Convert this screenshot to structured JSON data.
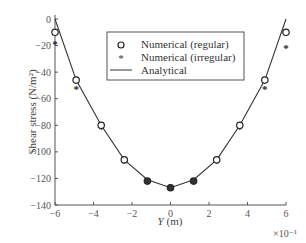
{
  "chart_data": {
    "type": "scatter",
    "title": "",
    "xlabel": "Y (m)",
    "ylabel": "Shear stress (N/m²)",
    "x_multiplier": "×10⁻¹",
    "xlim": [
      -6,
      6
    ],
    "ylim": [
      -140,
      0
    ],
    "xticks": [
      -6,
      -4,
      -2,
      0,
      2,
      4,
      6
    ],
    "yticks": [
      0,
      -20,
      -40,
      -60,
      -80,
      -100,
      -120,
      -140
    ],
    "grid": false,
    "legend_position": "upper center",
    "series": [
      {
        "name": "Numerical (regular)",
        "marker": "circle-open",
        "x": [
          -6,
          -4.9,
          -3.6,
          -2.4,
          -1.2,
          0,
          1.2,
          2.4,
          3.6,
          4.9,
          6
        ],
        "y": [
          -10,
          -46,
          -80,
          -106,
          -122,
          -127,
          -122,
          -106,
          -80,
          -46,
          -10
        ]
      },
      {
        "name": "Numerical (irregular)",
        "marker": "star",
        "x": [
          -6,
          -4.9,
          -3.6,
          -2.4,
          -1.2,
          0,
          1.2,
          2.4,
          3.6,
          4.9,
          6
        ],
        "y": [
          -18,
          -52,
          -82,
          -108,
          -122,
          -127,
          -122,
          -108,
          -82,
          -52,
          -21
        ]
      },
      {
        "name": "Analytical",
        "marker": "line",
        "x": [
          -6,
          -4.9,
          -3.6,
          -2.4,
          -1.2,
          0,
          1.2,
          2.4,
          3.6,
          4.9,
          6
        ],
        "y": [
          0,
          -46,
          -80,
          -106,
          -121,
          -127,
          -121,
          -106,
          -80,
          -46,
          0
        ]
      }
    ]
  },
  "labels": {
    "xlabel_italic": "Y",
    "xlabel_rest": " (m)",
    "ylabel": "Shear stress (N/m²)",
    "multiplier": "×10⁻¹",
    "legend": [
      "Numerical (regular)",
      "Numerical (irregular)",
      "Analytical"
    ]
  }
}
